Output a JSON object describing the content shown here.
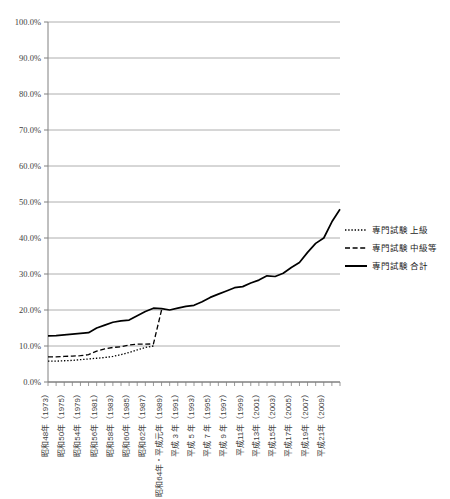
{
  "chart_data": {
    "type": "line",
    "title": "",
    "xlabel": "",
    "ylabel": "",
    "ylim": [
      0,
      100
    ],
    "ytick_labels": [
      "100.0%",
      "90.0%",
      "80.0%",
      "70.0%",
      "60.0%",
      "50.0%",
      "40.0%",
      "30.0%",
      "20.0%",
      "10.0%",
      "0.0%"
    ],
    "ytick_values": [
      100,
      90,
      80,
      70,
      60,
      50,
      40,
      30,
      20,
      10,
      0
    ],
    "grid": true,
    "legend_position": "right",
    "x": [
      1973,
      1974,
      1975,
      1976,
      1977,
      1978,
      1979,
      1980,
      1981,
      1982,
      1983,
      1984,
      1985,
      1986,
      1987,
      1988,
      1989,
      1990,
      1991,
      1992,
      1993,
      1994,
      1995,
      1996,
      1997,
      1998,
      1999,
      2000,
      2001,
      2002,
      2003,
      2004,
      2005,
      2006,
      2007,
      2008,
      2009
    ],
    "xtick_labels": [
      "昭和48年（1973）",
      "",
      "昭和50年（1975）",
      "",
      "昭和54年（1979）",
      "",
      "昭和56年（1981）",
      "",
      "昭和58年（1983）",
      "",
      "昭和60年（1985）",
      "",
      "昭和62年（1987）",
      "",
      "昭和64年・平成元年（1989）",
      "",
      "平成 3 年（1991）",
      "",
      "平成 5 年（1993）",
      "",
      "平成 7 年（1995）",
      "",
      "平成 9 年（1997）",
      "",
      "平成11年（1999）",
      "",
      "平成13年（2001）",
      "",
      "平成15年（2003）",
      "",
      "平成17年（2005）",
      "",
      "平成19年（2007）",
      "",
      "平成21年（2009）",
      "",
      ""
    ],
    "xtick_label_list": [
      "昭和48年（1973）",
      "昭和50年（1975）",
      "昭和54年（1979）",
      "昭和56年（1981）",
      "昭和58年（1983）",
      "昭和60年（1985）",
      "昭和62年（1987）",
      "昭和64年・平成元年（1989）",
      "平成 3 年（1991）",
      "平成 5 年（1993）",
      "平成 7 年（1995）",
      "平成 9 年（1997）",
      "平成11年（1999）",
      "平成13年（2001）",
      "平成15年（2003）",
      "平成17年（2005）",
      "平成19年（2007）",
      "平成21年（2009）"
    ],
    "series": [
      {
        "name": "専門試験 上級",
        "style": "dotted",
        "color": "#000000",
        "x": [
          1973,
          1974,
          1975,
          1976,
          1977,
          1978,
          1979,
          1980,
          1981,
          1982,
          1983,
          1984,
          1985,
          1986
        ],
        "values": [
          5.8,
          5.8,
          5.9,
          6.0,
          6.2,
          6.4,
          6.6,
          6.8,
          7.1,
          7.6,
          8.2,
          8.9,
          9.6,
          10.0
        ]
      },
      {
        "name": "専門試験 中級等",
        "style": "dashed",
        "color": "#000000",
        "x": [
          1973,
          1974,
          1975,
          1976,
          1977,
          1978,
          1979,
          1980,
          1981,
          1982,
          1983,
          1984,
          1985,
          1986,
          1987
        ],
        "values": [
          7.0,
          7.0,
          7.1,
          7.2,
          7.3,
          7.6,
          8.6,
          9.2,
          9.6,
          9.8,
          10.3,
          10.5,
          10.5,
          10.6,
          20.0
        ]
      },
      {
        "name": "専門試験 合計",
        "style": "solid",
        "color": "#000000",
        "x": [
          1973,
          1974,
          1975,
          1976,
          1977,
          1978,
          1979,
          1980,
          1981,
          1982,
          1983,
          1984,
          1985,
          1986,
          1987,
          1988,
          1989,
          1990,
          1991,
          1992,
          1993,
          1994,
          1995,
          1996,
          1997,
          1998,
          1999,
          2000,
          2001,
          2002,
          2003,
          2004,
          2005,
          2006,
          2007,
          2008,
          2009
        ],
        "values": [
          12.8,
          12.9,
          13.1,
          13.3,
          13.5,
          13.7,
          15.0,
          15.8,
          16.6,
          17.0,
          17.2,
          18.4,
          19.6,
          20.5,
          20.4,
          20.0,
          20.5,
          21.0,
          21.3,
          22.3,
          23.5,
          24.4,
          25.3,
          26.2,
          26.5,
          27.5,
          28.3,
          29.5,
          29.3,
          30.2,
          31.8,
          33.2,
          36.0,
          38.5,
          40.0,
          44.5,
          48.0
        ]
      }
    ]
  },
  "legend": {
    "items": [
      {
        "label": "専門試験 上級",
        "style": "dotted"
      },
      {
        "label": "専門試験 中級等",
        "style": "dashed"
      },
      {
        "label": "専門試験 合計",
        "style": "solid"
      }
    ]
  }
}
